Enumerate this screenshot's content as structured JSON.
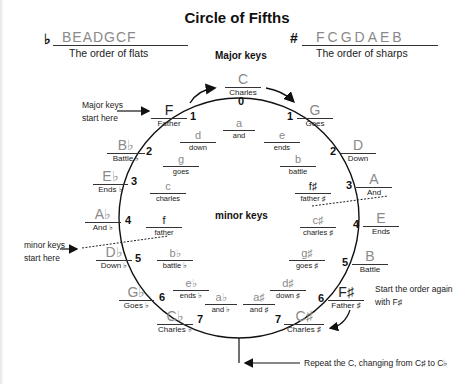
{
  "title": "Circle of Fifths",
  "flats": {
    "symbol": "♭",
    "order": "BEADGCF",
    "caption": "The order of flats"
  },
  "sharps": {
    "symbol": "#",
    "order": "FCGDAEB",
    "caption": "The order of sharps"
  },
  "major_keys_heading": "Major keys",
  "minor_keys_heading": "minor keys",
  "annotations": {
    "major_start": [
      "Major keys",
      "start here"
    ],
    "minor_start": [
      "minor keys",
      "start here"
    ],
    "restart": [
      "Start the order again",
      "with F♯"
    ],
    "repeat": "Repeat the C, changing from C♯ to C♭"
  },
  "top_key": {
    "note": "C",
    "word": "Charles",
    "count": "0"
  },
  "flat_major_keys": [
    {
      "note": "F",
      "word": "Father",
      "count": "1"
    },
    {
      "note": "B♭",
      "word": "Battle ♭",
      "count": "2"
    },
    {
      "note": "E♭",
      "word": "Ends ♭",
      "count": "3"
    },
    {
      "note": "A♭",
      "word": "And ♭",
      "count": "4"
    },
    {
      "note": "D♭",
      "word": "Down ♭",
      "count": "5"
    },
    {
      "note": "G♭",
      "word": "Goes ♭",
      "count": "6"
    },
    {
      "note": "C♭",
      "word": "Charles ♭",
      "count": "7"
    }
  ],
  "sharp_major_keys": [
    {
      "note": "G",
      "word": "Goes",
      "count": "1"
    },
    {
      "note": "D",
      "word": "Down",
      "count": "2"
    },
    {
      "note": "A",
      "word": "And",
      "count": "3"
    },
    {
      "note": "E",
      "word": "Ends",
      "count": "4"
    },
    {
      "note": "B",
      "word": "Battle",
      "count": "5"
    },
    {
      "note": "F♯",
      "word": "Father ♯",
      "count": "6"
    },
    {
      "note": "C♯",
      "word": "Charles ♯",
      "count": "7"
    }
  ],
  "top_minor": {
    "note": "a",
    "word": "and"
  },
  "flat_minor_keys": [
    {
      "note": "d",
      "word": "down"
    },
    {
      "note": "g",
      "word": "goes"
    },
    {
      "note": "c",
      "word": "charles"
    },
    {
      "note": "f",
      "word": "father"
    },
    {
      "note": "b♭",
      "word": "battle ♭"
    },
    {
      "note": "e♭",
      "word": "ends ♭"
    },
    {
      "note": "a♭",
      "word": "and ♭"
    }
  ],
  "sharp_minor_keys": [
    {
      "note": "e",
      "word": "ends"
    },
    {
      "note": "b",
      "word": "battle"
    },
    {
      "note": "f♯",
      "word": "father ♯"
    },
    {
      "note": "c♯",
      "word": "charles ♯"
    },
    {
      "note": "g♯",
      "word": "goes ♯"
    },
    {
      "note": "d♯",
      "word": "down ♯"
    },
    {
      "note": "a♯",
      "word": "and ♯"
    }
  ]
}
